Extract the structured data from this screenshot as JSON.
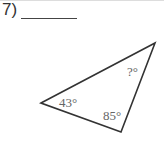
{
  "problem": {
    "number_label": "7)",
    "answer_blank": ""
  },
  "triangle": {
    "vertices": {
      "left": [
        41,
        103
      ],
      "top_right": [
        155,
        43
      ],
      "bottom": [
        121,
        132
      ]
    },
    "angles": {
      "left": "43°",
      "bottom": "85°",
      "top_right": "?°"
    },
    "stroke_color": "#333333",
    "label_color": "#666666"
  }
}
